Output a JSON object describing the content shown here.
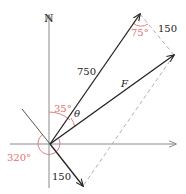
{
  "diagram": {
    "type": "vector-force-diagram",
    "colors": {
      "axis": "#8a8a8a",
      "vector": "#222222",
      "dashed": "#b0b0b0",
      "angle": "#e07070",
      "label": "#222222"
    },
    "axes": {
      "north_label": "N"
    },
    "vectors": {
      "v750": {
        "label": "750"
      },
      "v150": {
        "label": "150"
      },
      "resultant": {
        "label": "F"
      },
      "parallelogram_side": {
        "label": "150"
      }
    },
    "angles": {
      "a35": {
        "label": "35°"
      },
      "theta": {
        "label": "θ"
      },
      "a320": {
        "label": "320°"
      },
      "a75": {
        "label": "75°"
      }
    }
  }
}
